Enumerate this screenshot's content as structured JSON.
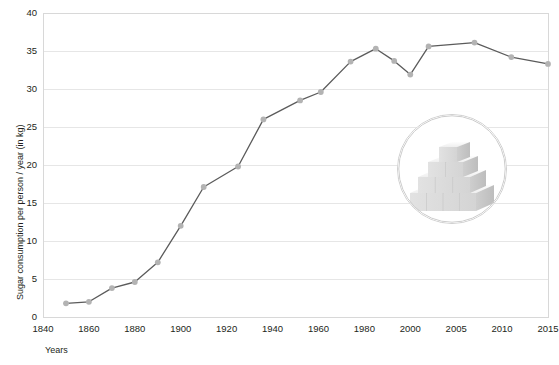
{
  "chart_data": {
    "type": "line",
    "title": "",
    "xlabel": "Years",
    "ylabel": "Sugar consumption per person / year (in kg)",
    "ylim": [
      0,
      40
    ],
    "ytick_labels": [
      "0",
      "5",
      "10",
      "15",
      "20",
      "25",
      "30",
      "35",
      "40"
    ],
    "yticks": [
      0,
      5,
      10,
      15,
      20,
      25,
      30,
      35,
      40
    ],
    "xtick_labels": [
      "1840",
      "1860",
      "1880",
      "1900",
      "1920",
      "1940",
      "1960",
      "1980",
      "2000",
      "2005",
      "2010",
      "2015"
    ],
    "xticks": [
      1840,
      1860,
      1880,
      1900,
      1920,
      1940,
      1960,
      1980,
      2000,
      2005,
      2010,
      2015
    ],
    "x_axis_note": "non-linear category axis: 20-year steps to 1980, then 5-year steps",
    "grid": "horizontal",
    "legend": "none",
    "series": [
      {
        "name": "Sugar consumption per person / year (in kg)",
        "x": [
          1850,
          1860,
          1870,
          1880,
          1890,
          1900,
          1910,
          1925,
          1936,
          1952,
          1961,
          1974,
          1985,
          1993,
          2000,
          2002,
          2007,
          2011,
          2015
        ],
        "values": [
          1.8,
          2.0,
          3.8,
          4.6,
          7.2,
          12.0,
          17.1,
          19.8,
          26.0,
          28.5,
          29.6,
          33.6,
          35.3,
          33.7,
          31.9,
          35.6,
          36.1,
          34.2,
          33.3
        ],
        "line_color": "#5b5b5b",
        "marker_color": "#b3b3b3"
      }
    ]
  },
  "colors": {
    "background": "#ffffff",
    "gridline": "#e6e6e6",
    "frame": "#d8d8d8",
    "text": "#231f20",
    "line": "#5b5b5b",
    "marker": "#b3b3b3"
  },
  "decoration": {
    "image_name": "sugar-cube-pyramid-photo",
    "description": "circular photo of a pyramid of white sugar cubes"
  }
}
